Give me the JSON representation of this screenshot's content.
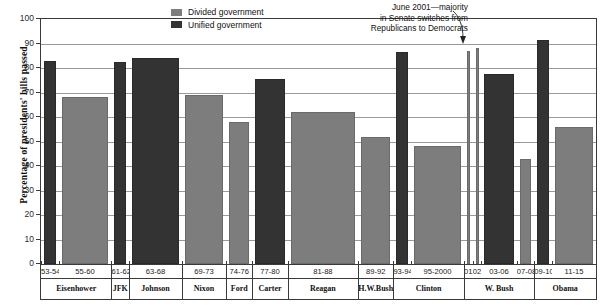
{
  "chart_data": {
    "type": "bar",
    "title": "",
    "xlabel": "",
    "ylabel": "Percentage of presidents' bills passed",
    "ylim": [
      0,
      100
    ],
    "ytick_values": [
      0,
      10,
      20,
      30,
      40,
      50,
      60,
      70,
      80,
      90,
      100
    ],
    "ytick_labels": [
      "0",
      "10",
      "20",
      "30",
      "40",
      "50",
      "60",
      "70",
      "80",
      "90",
      "100"
    ],
    "grid": true,
    "legend_position": "top-center",
    "legend": [
      {
        "key": "divided",
        "label": "Divided government",
        "color": "#7d7d7d"
      },
      {
        "key": "unified",
        "label": "Unified government",
        "color": "#333333"
      }
    ],
    "annotation": {
      "text_line1": "June 2001—majority",
      "text_line2": "in Senate switches from",
      "text_line3": "Republicans to Democrats",
      "points_to": "01"
    },
    "categories": [
      "53-54",
      "55-60",
      "61-62",
      "63-68",
      "69-73",
      "74-76",
      "77-80",
      "81-88",
      "89-92",
      "93-94",
      "95-2000",
      "01",
      "02",
      "03-06",
      "07-08",
      "09-10",
      "11-15"
    ],
    "points": [
      {
        "period": "53-54",
        "president": "Eisenhower",
        "value": 83,
        "government": "unified"
      },
      {
        "period": "55-60",
        "president": "Eisenhower",
        "value": 68,
        "government": "divided"
      },
      {
        "period": "61-62",
        "president": "JFK",
        "value": 82.5,
        "government": "unified"
      },
      {
        "period": "63-68",
        "president": "Johnson",
        "value": 84,
        "government": "unified"
      },
      {
        "period": "69-73",
        "president": "Nixon",
        "value": 69,
        "government": "divided"
      },
      {
        "period": "74-76",
        "president": "Ford",
        "value": 58,
        "government": "divided"
      },
      {
        "period": "77-80",
        "president": "Carter",
        "value": 75.5,
        "government": "unified"
      },
      {
        "period": "81-88",
        "president": "Reagan",
        "value": 62,
        "government": "divided"
      },
      {
        "period": "89-92",
        "president": "H.W.Bush",
        "value": 52,
        "government": "divided"
      },
      {
        "period": "93-94",
        "president": "Clinton",
        "value": 86.5,
        "government": "unified"
      },
      {
        "period": "95-2000",
        "president": "Clinton",
        "value": 48,
        "government": "divided"
      },
      {
        "period": "01",
        "president": "W. Bush",
        "value": 87,
        "government": "divided"
      },
      {
        "period": "02",
        "president": "W. Bush",
        "value": 88,
        "government": "divided"
      },
      {
        "period": "03-06",
        "president": "W. Bush",
        "value": 77.5,
        "government": "unified"
      },
      {
        "period": "07-08",
        "president": "W. Bush",
        "value": 43,
        "government": "divided"
      },
      {
        "period": "09-10",
        "president": "Obama",
        "value": 91.5,
        "government": "unified"
      },
      {
        "period": "11-15",
        "president": "Obama",
        "value": 56,
        "government": "divided"
      }
    ],
    "presidents": [
      {
        "name": "Eisenhower",
        "periods": [
          "53-54",
          "55-60"
        ]
      },
      {
        "name": "JFK",
        "periods": [
          "61-62"
        ]
      },
      {
        "name": "Johnson",
        "periods": [
          "63-68"
        ]
      },
      {
        "name": "Nixon",
        "periods": [
          "69-73"
        ]
      },
      {
        "name": "Ford",
        "periods": [
          "74-76"
        ]
      },
      {
        "name": "Carter",
        "periods": [
          "77-80"
        ]
      },
      {
        "name": "Reagan",
        "periods": [
          "81-88"
        ]
      },
      {
        "name": "H.W.Bush",
        "periods": [
          "89-92"
        ]
      },
      {
        "name": "Clinton",
        "periods": [
          "93-94",
          "95-2000"
        ]
      },
      {
        "name": "W. Bush",
        "periods": [
          "01",
          "02",
          "03-06",
          "07-08"
        ]
      },
      {
        "name": "Obama",
        "periods": [
          "09-10",
          "11-15"
        ]
      }
    ]
  }
}
